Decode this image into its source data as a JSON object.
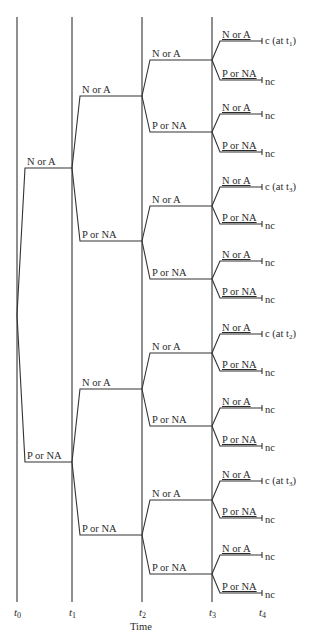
{
  "diagram": {
    "type": "event-tree",
    "axis": {
      "title": "Time",
      "ticks": [
        {
          "label": "t",
          "sub": "0",
          "x": 17
        },
        {
          "label": "t",
          "sub": "1",
          "x": 72
        },
        {
          "label": "t",
          "sub": "2",
          "x": 142
        },
        {
          "label": "t",
          "sub": "3",
          "x": 212
        },
        {
          "label": "t",
          "sub": "4",
          "x": 262
        }
      ]
    },
    "branch_labels": {
      "positive": "N or A",
      "negative": "P or NA"
    },
    "levels": {
      "t1": [
        {
          "label": "N or A",
          "y": 168
        },
        {
          "label": "P or NA",
          "y": 462
        }
      ],
      "t2": [
        {
          "label": "N or A",
          "y": 96
        },
        {
          "label": "P or NA",
          "y": 241
        },
        {
          "label": "N or A",
          "y": 389
        },
        {
          "label": "P or NA",
          "y": 535
        }
      ],
      "t3": [
        {
          "label": "N or A",
          "y": 60
        },
        {
          "label": "P or NA",
          "y": 132
        },
        {
          "label": "N or A",
          "y": 206
        },
        {
          "label": "P or NA",
          "y": 279
        },
        {
          "label": "N or A",
          "y": 353
        },
        {
          "label": "P or NA",
          "y": 426
        },
        {
          "label": "N or A",
          "y": 500
        },
        {
          "label": "P or NA",
          "y": 574
        }
      ],
      "t4": [
        {
          "label": "N or A",
          "y": 41,
          "outcome": "c (at t",
          "outcome_sub": "1",
          "outcome_tail": ")"
        },
        {
          "label": "P or NA",
          "y": 80,
          "outcome": "nc"
        },
        {
          "label": "N or A",
          "y": 114,
          "outcome": "nc"
        },
        {
          "label": "P or NA",
          "y": 152,
          "outcome": "nc"
        },
        {
          "label": "N or A",
          "y": 187,
          "outcome": "c (at t",
          "outcome_sub": "3",
          "outcome_tail": ")"
        },
        {
          "label": "P or NA",
          "y": 224,
          "outcome": "nc"
        },
        {
          "label": "N or A",
          "y": 261,
          "outcome": "nc"
        },
        {
          "label": "P or NA",
          "y": 298,
          "outcome": "nc"
        },
        {
          "label": "N or A",
          "y": 334,
          "outcome": "c (at t",
          "outcome_sub": "2",
          "outcome_tail": ")"
        },
        {
          "label": "P or NA",
          "y": 371,
          "outcome": "nc"
        },
        {
          "label": "N or A",
          "y": 408,
          "outcome": "nc"
        },
        {
          "label": "P or NA",
          "y": 446,
          "outcome": "nc"
        },
        {
          "label": "N or A",
          "y": 481,
          "outcome": "c (at t",
          "outcome_sub": "3",
          "outcome_tail": ")"
        },
        {
          "label": "P or NA",
          "y": 518,
          "outcome": "nc"
        },
        {
          "label": "N or A",
          "y": 555,
          "outcome": "nc"
        },
        {
          "label": "P or NA",
          "y": 593,
          "outcome": "nc"
        }
      ]
    },
    "root": {
      "x": 17,
      "y": 315
    }
  }
}
